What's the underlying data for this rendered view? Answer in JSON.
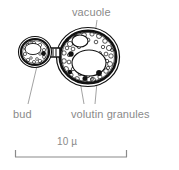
{
  "figure": {
    "type": "scientific-line-drawing",
    "background_color": "#ffffff",
    "ink_color": "#111111",
    "label_color": "#8a8a8a"
  },
  "labels": {
    "vacuole": "vacuole",
    "bud": "bud",
    "volutin_granules": "volutin granules"
  },
  "scale_bar": {
    "text": "10 µ",
    "value": 10,
    "unit": "µ",
    "x_start": 15,
    "x_end": 127,
    "y": 157
  },
  "structures": [
    {
      "name": "mother-cell",
      "cx": 88,
      "cy": 57,
      "rx": 32,
      "ry": 30
    },
    {
      "name": "bud-cell",
      "cx": 36,
      "cy": 52,
      "rx": 17,
      "ry": 16
    },
    {
      "name": "vacuole",
      "cx": 89,
      "cy": 63,
      "rx": 17,
      "ry": 13
    },
    {
      "name": "small-vacuole",
      "cx": 80,
      "cy": 42,
      "rx": 8,
      "ry": 6
    },
    {
      "name": "bud-vacuole",
      "cx": 33,
      "cy": 49,
      "rx": 8,
      "ry": 6
    },
    {
      "name": "isthmus",
      "x": 52,
      "y": 52
    }
  ],
  "volutin_granules": [
    {
      "cx": 71,
      "cy": 54,
      "r": 2.6
    },
    {
      "cx": 70,
      "cy": 72,
      "r": 2.2
    },
    {
      "cx": 85,
      "cy": 78,
      "r": 2.4
    },
    {
      "cx": 100,
      "cy": 73,
      "r": 2.8
    },
    {
      "cx": 44,
      "cy": 53,
      "r": 2.2
    }
  ],
  "leader_lines": [
    {
      "name": "vacuole-leader",
      "x1": 97,
      "y1": 20,
      "x2": 91,
      "y2": 62
    },
    {
      "name": "bud-leader",
      "x1": 28,
      "y1": 104,
      "x2": 37,
      "y2": 66
    },
    {
      "name": "volutin-leader-left",
      "x1": 84,
      "y1": 104,
      "x2": 80,
      "y2": 84
    },
    {
      "name": "volutin-leader-right",
      "x1": 95,
      "y1": 104,
      "x2": 97,
      "y2": 82
    }
  ]
}
